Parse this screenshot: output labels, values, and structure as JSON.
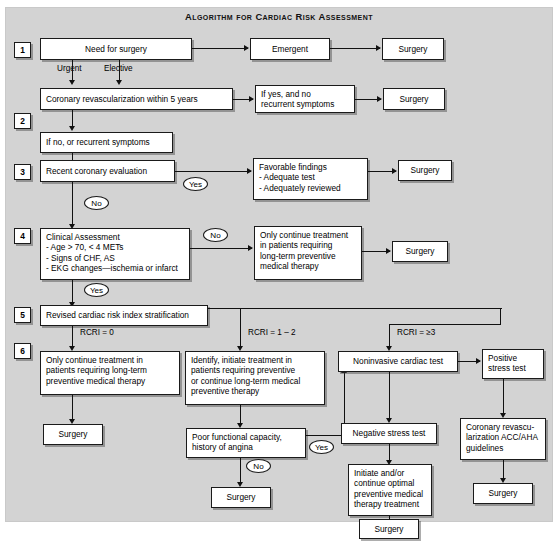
{
  "title": "Algorithm for Cardiac Risk Assessment",
  "steps": [
    {
      "n": "1"
    },
    {
      "n": "2"
    },
    {
      "n": "3"
    },
    {
      "n": "4"
    },
    {
      "n": "5"
    },
    {
      "n": "6"
    }
  ],
  "nodes": {
    "need_surgery": "Need for surgery",
    "emergent": "Emergent",
    "surgery_1": "Surgery",
    "revasc_5yr": "Coronary revascularization within 5 years",
    "if_yes_no_recurrent": "If yes, and no\nrecurrent symptoms",
    "surgery_2": "Surgery",
    "if_no_recurrent": "If no, or recurrent symptoms",
    "recent_eval": "Recent coronary evaluation",
    "favorable": "Favorable findings\n- Adequate test\n- Adequately reviewed",
    "surgery_3": "Surgery",
    "clinical_assessment": "Clinical Assessment\n- Age > 70, < 4 METs\n- Signs of CHF, AS\n- EKG changes—ischemia or infarct",
    "only_continue_4": "Only continue treatment\nin patients requiring\nlong-term preventive\nmedical therapy",
    "surgery_4": "Surgery",
    "rcri_strat": "Revised cardiac risk index stratification",
    "only_continue_6": "Only continue treatment in\npatients requiring long-term\npreventive medical therapy",
    "surgery_5": "Surgery",
    "identify_initiate": "Identify, initiate treatment in\npatients requiring preventive\nor continue long-term medical\npreventive therapy",
    "poor_functional": "Poor functional capacity,\nhistory of angina",
    "surgery_6": "Surgery",
    "noninvasive": "Noninvasive cardiac test",
    "negative_stress": "Negative stress test",
    "initiate_optimal": "Initiate and/or\ncontinue optimal\npreventive medical\ntherapy treatment",
    "surgery_7": "Surgery",
    "positive_stress": "Positive\nstress test",
    "coronary_revasc": "Coronary revascu-\nlarization ACC/AHA\nguidelines",
    "surgery_8": "Surgery"
  },
  "edge_labels": {
    "urgent": "Urgent",
    "elective": "Elective",
    "yes_3": "Yes",
    "no_3": "No",
    "no_4": "No",
    "yes_4": "Yes",
    "rcri_0": "RCRI = 0",
    "rcri_1_2": "RCRI = 1 – 2",
    "rcri_3": "RCRI = ≥3",
    "no_6": "No",
    "yes_6": "Yes"
  },
  "colors": {
    "panel_bg": "#d3d3d3",
    "box_bg": "#ffffff",
    "line": "#111111",
    "text": "#000000"
  }
}
